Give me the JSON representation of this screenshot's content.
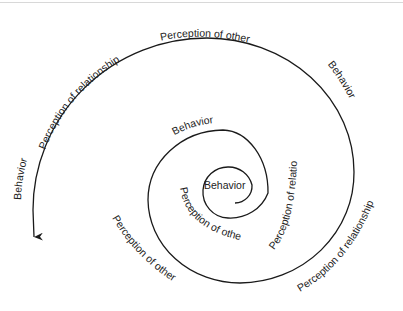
{
  "diagram": {
    "type": "spiral",
    "center_label": "Behavior",
    "labels": {
      "inner_loop": {
        "perception_of_other": "Perception of other",
        "perception_of_relationship": "Perception of relationship",
        "behavior": "Behavior"
      },
      "middle_loop": {
        "perception_of_other": "Perception of other",
        "perception_of_relationship": "Perception of relationship"
      },
      "outer_loop": {
        "behavior_right": "Behavior",
        "perception_of_other": "Perception of other",
        "perception_of_relationship": "Perception of relationship",
        "behavior_left": "Behavior"
      }
    },
    "colors": {
      "stroke": "#1a1a1a",
      "text": "#222222",
      "background": "#ffffff"
    }
  }
}
